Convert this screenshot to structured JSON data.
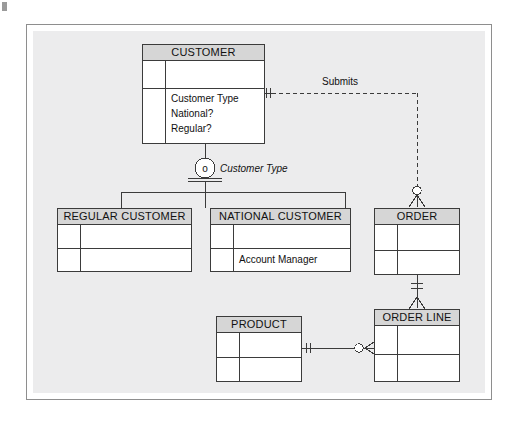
{
  "diagram": {
    "background_color": "#ececed",
    "frame_border_color": "#8e8e8e",
    "entity_header_fill": "#d6d6d6",
    "line_color": "#3b3b3b"
  },
  "entities": {
    "customer": {
      "name": "CUSTOMER",
      "attributes": [
        "Customer Type",
        "National?",
        "Regular?"
      ]
    },
    "regular_customer": {
      "name": "REGULAR CUSTOMER",
      "attributes": []
    },
    "national_customer": {
      "name": "NATIONAL CUSTOMER",
      "attributes": [
        "Account Manager"
      ]
    },
    "order": {
      "name": "ORDER",
      "attributes": []
    },
    "product": {
      "name": "PRODUCT",
      "attributes": []
    },
    "order_line": {
      "name": "ORDER LINE",
      "attributes": []
    }
  },
  "relationships": {
    "submits": {
      "label": "Submits",
      "from": "CUSTOMER",
      "to": "ORDER",
      "line_style": "dashed",
      "from_cardinality": "one-and-only-one",
      "to_cardinality": "zero-or-many"
    },
    "order_to_order_line": {
      "label": "",
      "from": "ORDER",
      "to": "ORDER LINE",
      "line_style": "solid",
      "from_cardinality": "one-and-only-one",
      "to_cardinality": "one-or-many"
    },
    "product_to_order_line": {
      "label": "",
      "from": "PRODUCT",
      "to": "ORDER LINE",
      "line_style": "solid",
      "from_cardinality": "one-and-only-one",
      "to_cardinality": "zero-or-many"
    }
  },
  "subtype": {
    "discriminator_label": "Customer Type",
    "rule_symbol": "o",
    "completeness": "total",
    "supertype": "CUSTOMER",
    "subtypes": [
      "REGULAR CUSTOMER",
      "NATIONAL CUSTOMER"
    ]
  }
}
